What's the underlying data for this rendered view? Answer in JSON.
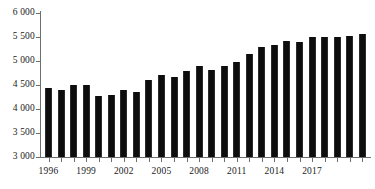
{
  "chart_data": {
    "type": "bar",
    "title": "",
    "subtitle": "",
    "xlabel": "",
    "ylabel": "",
    "ylim": [
      3000,
      6000
    ],
    "ytick_step": 500,
    "ytick_labels": [
      "6 000",
      "5 500",
      "5 000",
      "4 500",
      "4 000",
      "3 500",
      "3 000"
    ],
    "ytick_values": [
      6000,
      5500,
      5000,
      4500,
      4000,
      3500,
      3000
    ],
    "grid": false,
    "legend": null,
    "bar_color": "#0d0d0d",
    "axis_color": "#6e6e6e",
    "xtick_label_step": 3,
    "xtick_labels": [
      "1996",
      "1999",
      "2002",
      "2005",
      "2008",
      "2011",
      "2014",
      "2017"
    ],
    "categories": [
      "1996",
      "1997",
      "1998",
      "1999",
      "2000",
      "2001",
      "2002",
      "2003",
      "2004",
      "2005",
      "2006",
      "2007",
      "2008",
      "2009",
      "2010",
      "2011",
      "2012",
      "2013",
      "2014",
      "2015",
      "2016",
      "2017",
      "2018",
      "2019",
      "2020",
      "2021"
    ],
    "values": [
      4440,
      4400,
      4500,
      4500,
      4270,
      4290,
      4400,
      4360,
      4610,
      4700,
      4670,
      4790,
      4900,
      4810,
      4890,
      4980,
      5150,
      5290,
      5330,
      5420,
      5390,
      5500,
      5490,
      5500,
      5530,
      5570
    ]
  }
}
